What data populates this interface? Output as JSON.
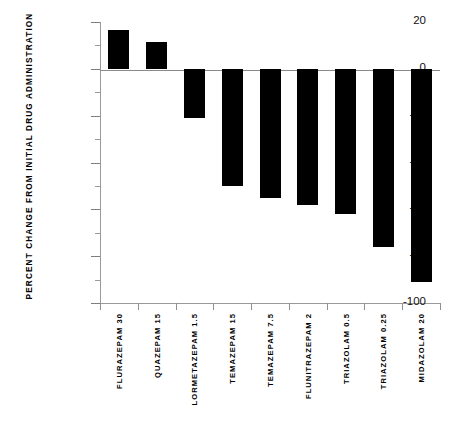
{
  "chart_data": {
    "type": "bar",
    "title": "",
    "xlabel": "",
    "ylabel": "PERCENT CHANGE FROM INITIAL DRUG ADMINISTRATION",
    "ylim": [
      -100,
      20
    ],
    "ytick_major": [
      20,
      0,
      -20,
      -40,
      -60,
      -80,
      -100
    ],
    "ytick_minor": [
      10,
      -10,
      -30,
      -50,
      -70,
      -90
    ],
    "ytick_labels": [
      "20",
      "0",
      "-20",
      "-40",
      "-60",
      "-80",
      "-100"
    ],
    "grid": false,
    "legend": false,
    "bar_color": "#000000",
    "axis_color": "#8a8a8a",
    "categories": [
      "FLURAZEPAM 30",
      "QUAZEPAM 15",
      "LORMETAZEPAM 1.5",
      "TEMAZEPAM 15",
      "TEMAZEPAM 7.5",
      "FLUNITRAZEPAM 2",
      "TRIAZOLAM 0.5",
      "TRIAZOLAM 0.25",
      "MIDAZOLAM 20"
    ],
    "values": [
      16.5,
      11.5,
      -21,
      -50,
      -55,
      -58,
      -62,
      -76,
      -91
    ]
  }
}
